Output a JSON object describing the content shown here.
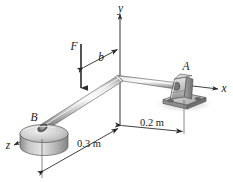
{
  "figure": {
    "background_color": "#ffffff",
    "line_color": "#1a1a1a",
    "metal_light": "#f2f2f2",
    "metal_mid": "#b9b9b9",
    "metal_dark": "#7d7d7d",
    "shadow_color": "#cfcfcf"
  },
  "axes": {
    "y_label": "y",
    "x_label": "x",
    "z_label": "z"
  },
  "supports": {
    "bearing_a_label": "A",
    "bearing_b_label": "B"
  },
  "load": {
    "force_label": "F",
    "offset_label": "b"
  },
  "dimensions": {
    "left_span": "0.3 m",
    "right_span": "0.2 m"
  }
}
